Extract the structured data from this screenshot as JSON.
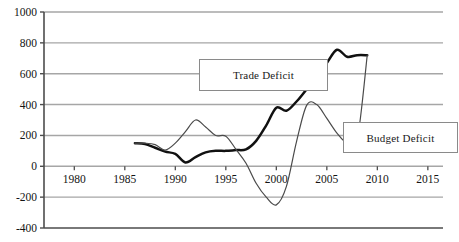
{
  "chart_data": {
    "type": "line",
    "title": "",
    "subtitle": "",
    "xlabel": "",
    "ylabel": "",
    "xlim": [
      1977,
      2016.5
    ],
    "ylim": [
      -400,
      1000
    ],
    "grid": true,
    "gridlines_y": [
      -200,
      0,
      200,
      400,
      600,
      800,
      1000
    ],
    "xticks": [
      1980,
      1985,
      1990,
      1995,
      2000,
      2005,
      2010,
      2015
    ],
    "xtick_labels": [
      "1980",
      "1985",
      "1990",
      "1995",
      "2000",
      "2005",
      "2010",
      "2015"
    ],
    "yticks": [
      -400,
      -200,
      0,
      200,
      400,
      600,
      800,
      1000
    ],
    "ytick_labels": [
      "-400",
      "-200",
      "0",
      "200",
      "400",
      "600",
      "800",
      "1000"
    ],
    "legend_position": "inside-annotations",
    "series": [
      {
        "name": "Trade Deficit",
        "style": "thick-black",
        "color": "#111111",
        "x": [
          1986,
          1987,
          1988,
          1989,
          1990,
          1991,
          1992,
          1993,
          1994,
          1995,
          1996,
          1997,
          1998,
          1999,
          2000,
          2001,
          2002,
          2003,
          2004,
          2005,
          2006,
          2007,
          2008,
          2009
        ],
        "values": [
          150,
          145,
          120,
          95,
          80,
          25,
          60,
          90,
          100,
          100,
          105,
          110,
          165,
          265,
          380,
          360,
          420,
          500,
          590,
          670,
          755,
          710,
          720,
          720
        ]
      },
      {
        "name": "Budget Deficit",
        "style": "thin-gray",
        "color": "#4a4a4a",
        "x": [
          1986,
          1987,
          1988,
          1989,
          1990,
          1991,
          1992,
          1993,
          1994,
          1995,
          1996,
          1997,
          1998,
          1999,
          2000,
          2001,
          2002,
          2003,
          2004,
          2005,
          2006,
          2007,
          2008,
          2009
        ],
        "values": [
          150,
          150,
          140,
          105,
          150,
          225,
          300,
          255,
          200,
          195,
          110,
          20,
          -110,
          -200,
          -250,
          -130,
          160,
          395,
          400,
          310,
          215,
          150,
          170,
          720
        ]
      }
    ],
    "annotations": [
      {
        "label": "Trade Deficit",
        "type": "callout-box",
        "target_series": "Trade Deficit"
      },
      {
        "label": "Budget Deficit",
        "type": "callout-box",
        "target_series": "Budget Deficit"
      }
    ],
    "colors": {
      "axis": "#4d4d4d",
      "gridline": "#a6a6a6",
      "trade_line": "#111111",
      "budget_line": "#4a4a4a",
      "background": "#ffffff",
      "text": "#141414",
      "legend_border": "#8a8a8a"
    }
  },
  "legend": {
    "trade_label": "Trade Deficit",
    "budget_label": "Budget Deficit"
  }
}
